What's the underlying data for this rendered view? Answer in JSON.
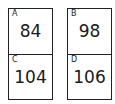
{
  "cards": [
    {
      "cells": [
        {
          "label": "A",
          "value": "84"
        },
        {
          "label": "C",
          "value": "104"
        }
      ]
    },
    {
      "cells": [
        {
          "label": "B",
          "value": "98"
        },
        {
          "label": "D",
          "value": "106"
        }
      ]
    }
  ]
}
